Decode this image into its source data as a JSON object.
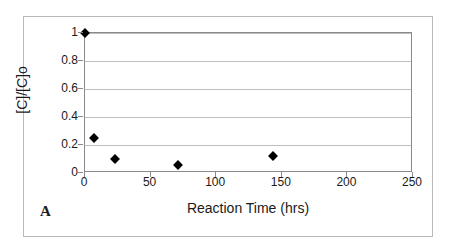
{
  "figure": {
    "panel_letter": "A",
    "background_color": "#ffffff",
    "frame_color": "#b9b9b9",
    "axis_color": "#8a8a8a",
    "grid_color": "#bfbfbf",
    "marker_color": "#000000"
  },
  "chart_data": {
    "type": "scatter",
    "title": "",
    "xlabel": "Reaction Time (hrs)",
    "ylabel": "[C]/[C]o",
    "xlim": [
      0,
      250
    ],
    "ylim": [
      0,
      1
    ],
    "xticks": [
      0,
      50,
      100,
      150,
      200,
      250
    ],
    "xtick_labels": [
      "0",
      "50",
      "100",
      "150",
      "200",
      "250"
    ],
    "yticks": [
      0,
      0.2,
      0.4,
      0.6,
      0.8,
      1
    ],
    "ytick_labels": [
      "0",
      "0.2",
      "0.4",
      "0.6",
      "0.8",
      "1"
    ],
    "grid": "horizontal",
    "legend": null,
    "marker": "diamond",
    "series": [
      {
        "name": "[C]/[C]o",
        "points": [
          {
            "x": 0,
            "y": 1.0
          },
          {
            "x": 7,
            "y": 0.25
          },
          {
            "x": 23,
            "y": 0.1
          },
          {
            "x": 71,
            "y": 0.06
          },
          {
            "x": 143,
            "y": 0.12
          }
        ]
      }
    ]
  }
}
